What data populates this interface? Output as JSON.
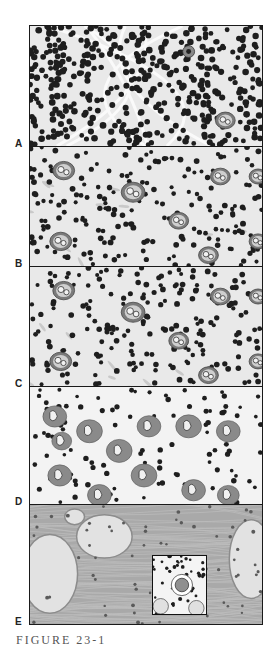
{
  "figure": {
    "caption": "FIGURE 23-1",
    "panels": [
      {
        "label": "A",
        "top": 25,
        "height": 122,
        "style": "dense"
      },
      {
        "label": "B",
        "top": 146,
        "height": 121,
        "style": "mixed"
      },
      {
        "label": "C",
        "top": 266,
        "height": 121,
        "style": "mixed"
      },
      {
        "label": "D",
        "top": 386,
        "height": 119,
        "style": "lobed"
      },
      {
        "label": "E",
        "top": 504,
        "height": 121,
        "style": "fibrous"
      }
    ],
    "inset": {
      "panel": "E",
      "left": 152,
      "top": 555,
      "width": 55,
      "height": 60
    },
    "colors": {
      "border": "#1a1a1a",
      "nucleus": "#1e1e1e",
      "cytoplasm": "#7a7a7a",
      "background": "#e9e9e9",
      "fiber": "#9a9a9a"
    }
  }
}
